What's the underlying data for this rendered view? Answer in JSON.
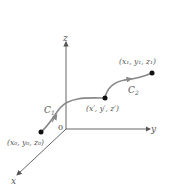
{
  "diagram": {
    "axes": {
      "x": "x",
      "y": "y",
      "z": "z",
      "origin": "0"
    },
    "curves": [
      {
        "name": "C1",
        "label": "C",
        "sub": "1"
      },
      {
        "name": "C2",
        "label": "C",
        "sub": "2"
      }
    ],
    "points": {
      "start": {
        "label": "(x₀, y₀, z₀)"
      },
      "mid": {
        "label": "(x′, y′, z′)"
      },
      "end": {
        "label": "(x₁, y₁, z₁)"
      }
    },
    "colors": {
      "axis": "#555555",
      "curve": "#888888",
      "point": "#111111"
    }
  }
}
